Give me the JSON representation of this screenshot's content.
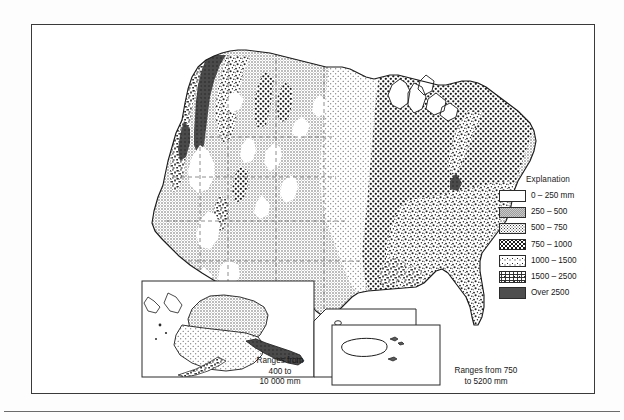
{
  "figure": {
    "kind": "thematic-map",
    "units": "mm"
  },
  "legend": {
    "title": "Explanation",
    "entries": [
      {
        "label": "0 – 250 mm",
        "pattern": "blank",
        "min": 0,
        "max": 250
      },
      {
        "label": "250 – 500",
        "pattern": "light-gray",
        "min": 250,
        "max": 500
      },
      {
        "label": "500 – 750",
        "pattern": "fine-stipple",
        "min": 500,
        "max": 750
      },
      {
        "label": "750 – 1000",
        "pattern": "bold-dots",
        "min": 750,
        "max": 1000
      },
      {
        "label": "1000 – 1500",
        "pattern": "coarse-speck",
        "min": 1000,
        "max": 1500
      },
      {
        "label": "1500 – 2500",
        "pattern": "mottled",
        "min": 1500,
        "max": 2500
      },
      {
        "label": "Over 2500",
        "pattern": "solid-dark",
        "min": 2500,
        "max": null
      }
    ]
  },
  "insets": [
    {
      "name": "alaska-hawaii",
      "caption_lines": [
        "Ranges from",
        "400 to",
        "10 000 mm"
      ],
      "range_min": 400,
      "range_max": 10000
    },
    {
      "name": "puerto-rico",
      "caption_lines": [
        "Ranges from 750",
        "to 5200 mm"
      ],
      "range_min": 750,
      "range_max": 5200
    }
  ],
  "colors": {
    "ink": "#1c1c1c",
    "frame": "#3a3a3a",
    "band_250_500": "#c9c9c9",
    "band_over_2500": "#555555",
    "paper": "#ffffff"
  }
}
